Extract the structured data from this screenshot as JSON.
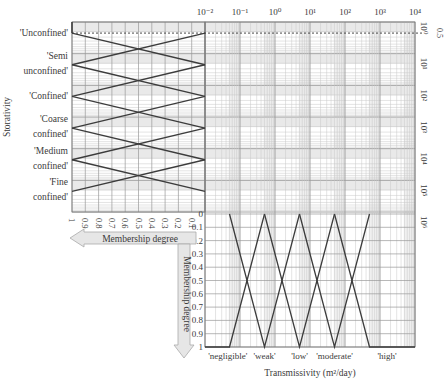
{
  "chart_data": [
    {
      "type": "line",
      "panel": "storativity-membership",
      "title": "",
      "xlabel": "Membership degree",
      "ylabel": "Storativity",
      "x_ticks": [
        "1",
        "0.9",
        "0.8",
        "0.7",
        "0.6",
        "0.5",
        "0.4",
        "0.3",
        "0.2",
        "0.1",
        "0"
      ],
      "x_direction": "reversed",
      "y_scale": "log",
      "y_tick_labels_right": [
        "10⁰",
        "10¹",
        "10²",
        "10³",
        "10⁴",
        "10⁵",
        "10⁶"
      ],
      "y_exponents": [
        0,
        1,
        2,
        3,
        4,
        5,
        6
      ],
      "annotation": {
        "label": "0.5",
        "style": "dashed",
        "y_exponent": 0.35
      },
      "categories": [
        "'Unconfined'",
        "'Semi unconfined'",
        "'Confined'",
        "'Coarse confined'",
        "'Medium confined'",
        "'Fine confined'"
      ],
      "category_label_lines": [
        [
          "'Unconfined'"
        ],
        [
          "'Semi",
          "unconfined'"
        ],
        [
          "'Confined'"
        ],
        [
          "'Coarse",
          "confined'"
        ],
        [
          "'Medium",
          "confined'"
        ],
        [
          "'Fine",
          "confined'"
        ]
      ],
      "category_peaks_exponent": [
        0.35,
        1.35,
        2.35,
        3.35,
        4.35,
        5.35
      ],
      "grid": true
    },
    {
      "type": "line",
      "panel": "transmissivity-membership",
      "title": "",
      "xlabel": "Transmissivity (m²/day)",
      "ylabel": "Membership degree",
      "x_scale": "log",
      "x_tick_labels": [
        "10⁻²",
        "10⁻¹",
        "10⁰",
        "10¹",
        "10²",
        "10³",
        "10⁴"
      ],
      "x_exponents": [
        -2,
        -1,
        0,
        1,
        2,
        3,
        4
      ],
      "y_ticks": [
        "0",
        "0.1",
        "0.2",
        "0.3",
        "0.4",
        "0.5",
        "0.6",
        "0.7",
        "0.8",
        "0.9",
        "1"
      ],
      "y_direction": "reversed",
      "categories": [
        "'negligible'",
        "'weak'",
        "'low'",
        "'moderate'",
        "'high'"
      ],
      "series": [
        {
          "name": "'negligible'",
          "points": [
            [
              -2,
              1
            ],
            [
              -1.3,
              1
            ],
            [
              -0.3,
              0
            ]
          ]
        },
        {
          "name": "'weak'",
          "points": [
            [
              -1.3,
              0
            ],
            [
              -0.3,
              1
            ],
            [
              0.7,
              0
            ]
          ]
        },
        {
          "name": "'low'",
          "points": [
            [
              -0.3,
              0
            ],
            [
              0.7,
              1
            ],
            [
              1.7,
              0
            ]
          ]
        },
        {
          "name": "'moderate'",
          "points": [
            [
              0.7,
              0
            ],
            [
              1.7,
              1
            ],
            [
              2.7,
              0
            ]
          ]
        },
        {
          "name": "'high'",
          "points": [
            [
              1.7,
              0
            ],
            [
              2.7,
              1
            ],
            [
              4,
              1
            ]
          ]
        }
      ],
      "label_x_exponents": [
        -1.35,
        -0.3,
        0.7,
        1.7,
        3.2
      ],
      "grid": true
    }
  ],
  "labels": {
    "storativity_axis": "Storativity",
    "membership_horizontal": "Membership degree",
    "membership_vertical": "Membership degree",
    "transmissivity_axis": "Transmissivity (m²/day)",
    "dashed_value": "0.5"
  },
  "colors": {
    "line": "#3c3c3c",
    "grid_major": "#9a9a9a",
    "grid_minor": "#c8c8c8",
    "band": "#e9e9e9",
    "arrow_fill": "#e6e6e6",
    "arrow_stroke": "#aaaaaa",
    "text": "#3a3a3a"
  }
}
